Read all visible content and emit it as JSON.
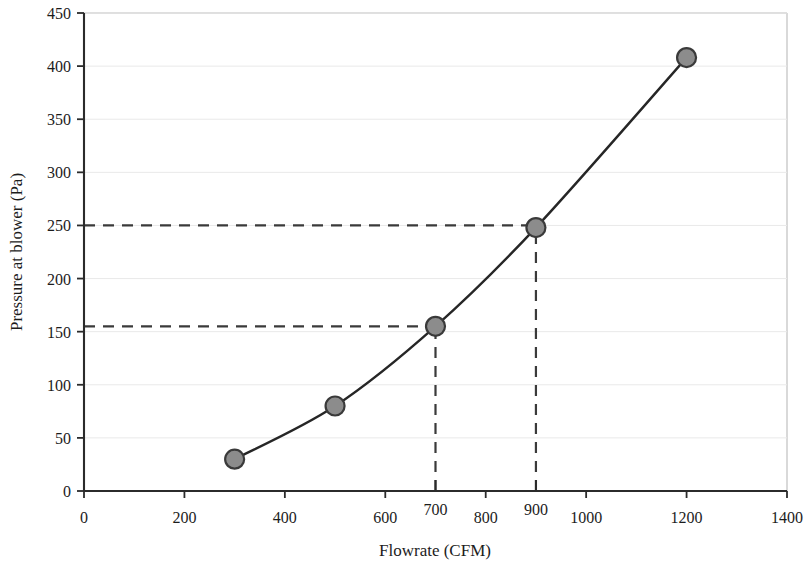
{
  "chart_data": {
    "type": "line",
    "title": "",
    "xlabel": "Flowrate (CFM)",
    "ylabel": "Pressure at blower (Pa)",
    "xlim": [
      0,
      1400
    ],
    "ylim": [
      0,
      450
    ],
    "xticks": [
      0,
      200,
      400,
      600,
      800,
      1000,
      1200,
      1400
    ],
    "xtick_labels": [
      "0",
      "200",
      "400",
      "600",
      "800",
      "1000",
      "1200",
      "1400"
    ],
    "extra_xticks": [
      700,
      900
    ],
    "extra_xtick_labels": [
      "700",
      "900"
    ],
    "yticks": [
      0,
      50,
      100,
      150,
      200,
      250,
      300,
      350,
      400,
      450
    ],
    "ytick_labels": [
      "0",
      "50",
      "100",
      "150",
      "200",
      "250",
      "300",
      "350",
      "400",
      "450"
    ],
    "grid": "horizontal-faint",
    "legend": "none",
    "series": [
      {
        "name": "Blower curve",
        "x": [
          300,
          500,
          700,
          900,
          1200
        ],
        "values": [
          30,
          80,
          155,
          248,
          408
        ],
        "marker": "filled-circle",
        "marker_color": "#8c8c8c",
        "marker_edge_color": "#3a3a3a",
        "line_color": "#262626",
        "line_width": 2.4,
        "smooth": true
      }
    ],
    "annotations": [
      {
        "name": "guide-h-250",
        "type": "dashed-horizontal",
        "y": 250,
        "x_from": 0,
        "x_to": 900
      },
      {
        "name": "guide-h-155",
        "type": "dashed-horizontal",
        "y": 155,
        "x_from": 0,
        "x_to": 700
      },
      {
        "name": "guide-v-900",
        "type": "dashed-vertical",
        "x": 900,
        "y_from": 0,
        "y_to": 248
      },
      {
        "name": "guide-v-700",
        "type": "dashed-vertical",
        "x": 700,
        "y_from": 0,
        "y_to": 155
      }
    ],
    "colors": {
      "axis": "#2b2b2b",
      "grid": "#e9e9e9",
      "plot_border": "#c9c9c9",
      "guide": "#3a3a3a",
      "background": "#ffffff"
    }
  }
}
